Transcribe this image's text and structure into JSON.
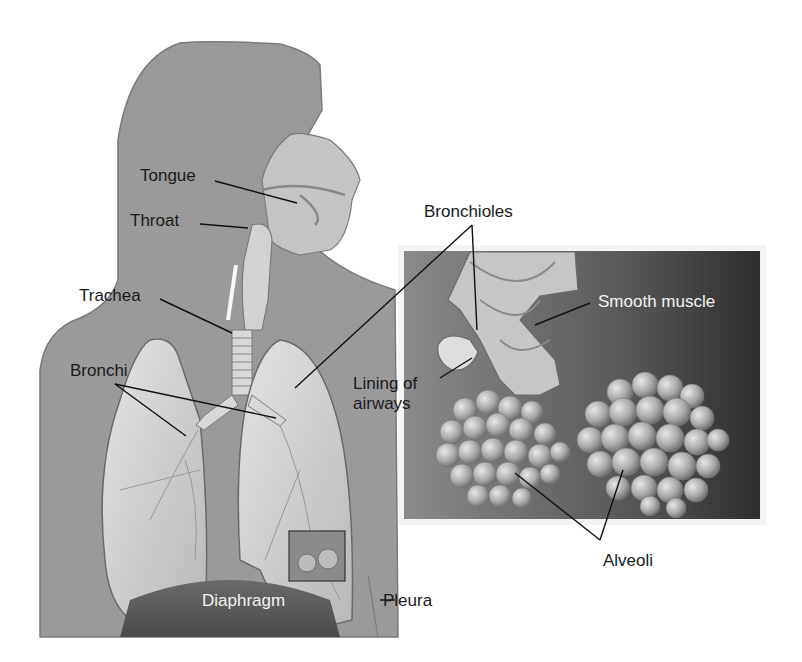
{
  "diagram": {
    "colors": {
      "background": "#ffffff",
      "silhouette": "#9a9a9a",
      "lung": "#cfcfcf",
      "inset_bg": "#4a4a4a",
      "label_text": "#1a1a1a",
      "label_text_light": "#f2f2f2"
    },
    "labels": {
      "tongue": "Tongue",
      "throat": "Throat",
      "trachea": "Trachea",
      "bronchi": "Bronchi",
      "bronchioles": "Bronchioles",
      "smooth_muscle": "Smooth muscle",
      "lining_of_airways": "Lining of\nairways",
      "alveoli": "Alveoli",
      "diaphragm": "Diaphragm",
      "pleura": "Pleura"
    }
  }
}
